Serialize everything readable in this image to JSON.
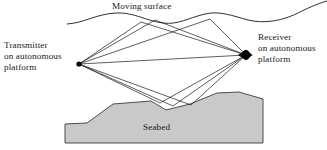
{
  "figure": {
    "background_color": "#ffffff",
    "line_color": "#1a1a1a",
    "seabed_fill_color": "#c9c9c9",
    "seabed_stroke_color": "#4d4d4d",
    "marker_color": "#000000"
  },
  "labels": {
    "moving_surface": "Moving surface",
    "seabed": "Seabed",
    "transmitter": {
      "line1": "Transmitter",
      "line2": "on autonomous",
      "line3": "platform"
    },
    "receiver": {
      "line1": "Receiver",
      "line2": "on autonomous",
      "line3": "platform"
    }
  },
  "nodes": {
    "transmitter": {
      "x": 79,
      "y": 64,
      "radius": 2.6
    },
    "receiver": {
      "x": 246,
      "y": 55,
      "radius": 5.0
    }
  },
  "geometry": {
    "moving_surface_path": "M 67,24 C 84,23 96,14 116,13 C 134,12 146,21 163,23 C 178,25 188,18 205,14 C 220,10.5 233,16 248,20 C 264,24 283,21 300,12 C 312,6 320,3 327,1",
    "seabed_polygon": "65,124 87,123 113,104 151,101 166,110 190,104 217,93 239,92 263,99 263,143 65,143",
    "ray_paths": [
      "M 79,64 L 246,55",
      "M 79,64 L 155,20 L 246,55",
      "M 79,64 L 210,19 L 246,55",
      "M 79,64 L 160,103 L 246,55",
      "M 79,64 L 191,105 L 246,55",
      "M 79,64 L 141,22 L 246,55",
      "M 79,64 L 173,106 L 246,55"
    ]
  }
}
